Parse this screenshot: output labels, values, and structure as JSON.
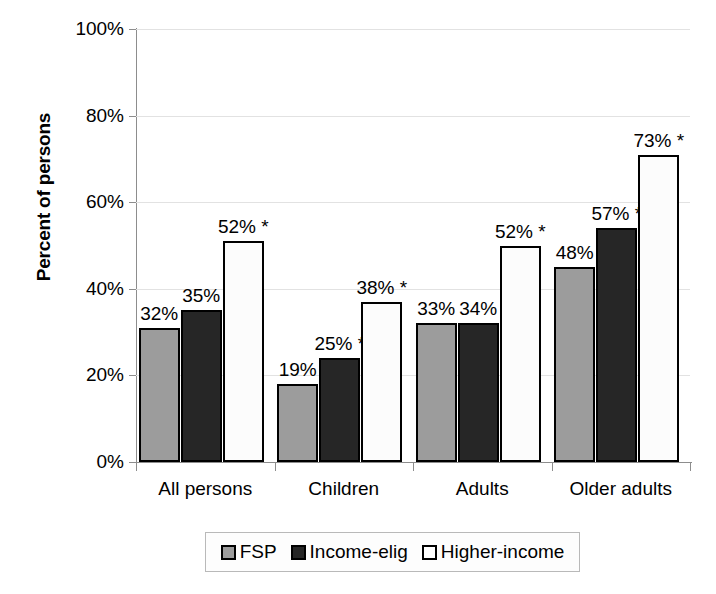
{
  "chart_data": {
    "type": "bar",
    "title": "",
    "xlabel": "",
    "ylabel": "Percent of persons",
    "ylim": [
      0,
      100
    ],
    "yticks": [
      "0%",
      "20%",
      "40%",
      "60%",
      "80%",
      "100%"
    ],
    "grid": true,
    "legend_position": "bottom",
    "categories": [
      "All persons",
      "Children",
      "Adults",
      "Older adults"
    ],
    "series": [
      {
        "name": "FSP",
        "color": "#9c9c9c",
        "values": [
          32,
          19,
          33,
          48
        ],
        "labels": [
          "32%",
          "19%",
          "33%",
          "48%"
        ],
        "plotted": [
          31,
          18,
          32,
          45
        ]
      },
      {
        "name": "Income-elig",
        "color": "#262626",
        "values": [
          35,
          25,
          34,
          57
        ],
        "labels": [
          "35%",
          "25% *",
          "34%",
          "57% *"
        ],
        "plotted": [
          35,
          24,
          32,
          54
        ]
      },
      {
        "name": "Higher-income",
        "color": "#ffffff",
        "values": [
          52,
          38,
          52,
          73
        ],
        "labels": [
          "52% *",
          "38% *",
          "52% *",
          "73% *"
        ],
        "plotted": [
          51,
          37,
          50,
          71
        ]
      }
    ],
    "footnote_marker": "*"
  },
  "legend": {
    "items": [
      {
        "label": "FSP",
        "swatch": "fsp"
      },
      {
        "label": "Income-elig",
        "swatch": "income-elig"
      },
      {
        "label": "Higher-income",
        "swatch": "higher-income"
      }
    ]
  }
}
